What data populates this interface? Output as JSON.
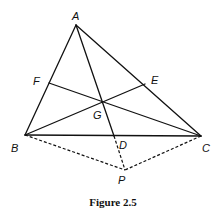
{
  "figure": {
    "caption": "Figure 2.5",
    "points": {
      "A": {
        "label": "A",
        "x": 76,
        "y": 25
      },
      "B": {
        "label": "B",
        "x": 25,
        "y": 135
      },
      "C": {
        "label": "C",
        "x": 201,
        "y": 136
      },
      "D": {
        "label": "D",
        "x": 114,
        "y": 136
      },
      "E": {
        "label": "E",
        "x": 145,
        "y": 84
      },
      "F": {
        "label": "F",
        "x": 49,
        "y": 83
      },
      "G": {
        "label": "G",
        "x": 101,
        "y": 101
      },
      "P": {
        "label": "P",
        "x": 125,
        "y": 170
      }
    },
    "solid_segments": [
      [
        "A",
        "B"
      ],
      [
        "A",
        "C"
      ],
      [
        "B",
        "C"
      ],
      [
        "A",
        "D"
      ],
      [
        "B",
        "E"
      ],
      [
        "C",
        "F"
      ]
    ],
    "dashed_segments": [
      [
        "B",
        "P"
      ],
      [
        "C",
        "P"
      ],
      [
        "D",
        "P"
      ]
    ],
    "colors": {
      "stroke": "#111111",
      "background": "#ffffff"
    }
  }
}
